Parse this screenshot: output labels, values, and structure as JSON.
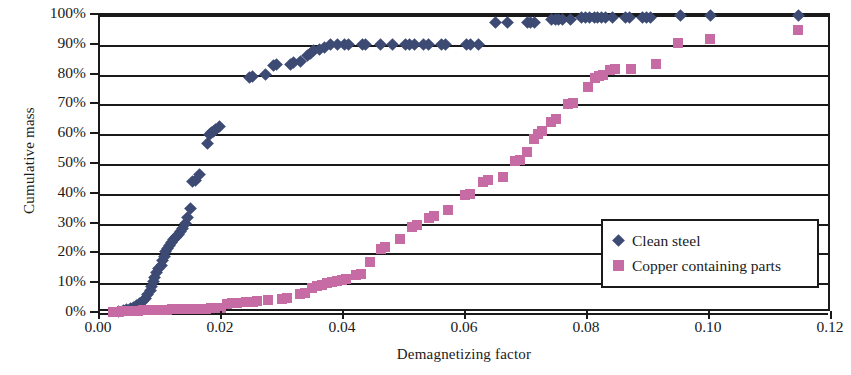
{
  "chart_data": {
    "type": "scatter",
    "title": "",
    "xlabel": "Demagnetizing factor",
    "ylabel": "Cumulative mass",
    "xlim": [
      0.0,
      0.12
    ],
    "ylim": [
      0,
      1.0
    ],
    "xticks": [
      0.0,
      0.02,
      0.04,
      0.06,
      0.08,
      0.1,
      0.12
    ],
    "xtick_labels": [
      "0.00",
      "0.02",
      "0.04",
      "0.06",
      "0.08",
      "0.10",
      "0.12"
    ],
    "yticks": [
      0,
      0.1,
      0.2,
      0.3,
      0.4,
      0.5,
      0.6,
      0.7,
      0.8,
      0.9,
      1.0
    ],
    "ytick_labels": [
      "0%",
      "10%",
      "20%",
      "30%",
      "40%",
      "50%",
      "60%",
      "70%",
      "80%",
      "90%",
      "100%"
    ],
    "grid": "horizontal",
    "legend_position": "inside-lower-right",
    "series": [
      {
        "name": "Clean steel",
        "marker": "diamond",
        "color": "#3c4a74",
        "points": [
          [
            0.003,
            0.005
          ],
          [
            0.0038,
            0.008
          ],
          [
            0.0044,
            0.012
          ],
          [
            0.005,
            0.016
          ],
          [
            0.0055,
            0.02
          ],
          [
            0.006,
            0.026
          ],
          [
            0.0065,
            0.032
          ],
          [
            0.007,
            0.04
          ],
          [
            0.0074,
            0.05
          ],
          [
            0.0078,
            0.062
          ],
          [
            0.0082,
            0.075
          ],
          [
            0.0085,
            0.09
          ],
          [
            0.0088,
            0.105
          ],
          [
            0.009,
            0.12
          ],
          [
            0.0093,
            0.135
          ],
          [
            0.0096,
            0.15
          ],
          [
            0.01,
            0.16
          ],
          [
            0.0103,
            0.175
          ],
          [
            0.0106,
            0.19
          ],
          [
            0.0108,
            0.205
          ],
          [
            0.0111,
            0.215
          ],
          [
            0.0114,
            0.225
          ],
          [
            0.0117,
            0.235
          ],
          [
            0.012,
            0.245
          ],
          [
            0.0123,
            0.252
          ],
          [
            0.0126,
            0.258
          ],
          [
            0.0129,
            0.265
          ],
          [
            0.0132,
            0.272
          ],
          [
            0.0136,
            0.285
          ],
          [
            0.014,
            0.3
          ],
          [
            0.0144,
            0.32
          ],
          [
            0.0148,
            0.35
          ],
          [
            0.0152,
            0.44
          ],
          [
            0.0156,
            0.445
          ],
          [
            0.0163,
            0.465
          ],
          [
            0.0176,
            0.57
          ],
          [
            0.018,
            0.6
          ],
          [
            0.0183,
            0.605
          ],
          [
            0.0186,
            0.61
          ],
          [
            0.019,
            0.615
          ],
          [
            0.0196,
            0.625
          ],
          [
            0.0245,
            0.79
          ],
          [
            0.025,
            0.795
          ],
          [
            0.0272,
            0.8
          ],
          [
            0.0285,
            0.83
          ],
          [
            0.029,
            0.835
          ],
          [
            0.0312,
            0.835
          ],
          [
            0.0318,
            0.84
          ],
          [
            0.0328,
            0.845
          ],
          [
            0.034,
            0.865
          ],
          [
            0.0345,
            0.87
          ],
          [
            0.035,
            0.88
          ],
          [
            0.036,
            0.885
          ],
          [
            0.0368,
            0.89
          ],
          [
            0.0378,
            0.9
          ],
          [
            0.039,
            0.9
          ],
          [
            0.04,
            0.9
          ],
          [
            0.0408,
            0.9
          ],
          [
            0.043,
            0.9
          ],
          [
            0.0436,
            0.9
          ],
          [
            0.046,
            0.9
          ],
          [
            0.048,
            0.9
          ],
          [
            0.05,
            0.9
          ],
          [
            0.0508,
            0.9
          ],
          [
            0.0516,
            0.9
          ],
          [
            0.053,
            0.9
          ],
          [
            0.0538,
            0.9
          ],
          [
            0.056,
            0.9
          ],
          [
            0.0566,
            0.9
          ],
          [
            0.06,
            0.9
          ],
          [
            0.0608,
            0.9
          ],
          [
            0.062,
            0.9
          ],
          [
            0.0648,
            0.975
          ],
          [
            0.0668,
            0.975
          ],
          [
            0.07,
            0.975
          ],
          [
            0.0706,
            0.975
          ],
          [
            0.0712,
            0.975
          ],
          [
            0.074,
            0.985
          ],
          [
            0.0746,
            0.985
          ],
          [
            0.0752,
            0.985
          ],
          [
            0.0758,
            0.985
          ],
          [
            0.0772,
            0.985
          ],
          [
            0.079,
            0.99
          ],
          [
            0.0796,
            0.99
          ],
          [
            0.0802,
            0.99
          ],
          [
            0.081,
            0.99
          ],
          [
            0.0816,
            0.99
          ],
          [
            0.0822,
            0.99
          ],
          [
            0.0828,
            0.99
          ],
          [
            0.084,
            0.99
          ],
          [
            0.0862,
            0.99
          ],
          [
            0.0868,
            0.99
          ],
          [
            0.089,
            0.99
          ],
          [
            0.0896,
            0.99
          ],
          [
            0.0902,
            0.99
          ],
          [
            0.0952,
            0.998
          ],
          [
            0.1,
            0.998
          ],
          [
            0.1145,
            1.0
          ]
        ]
      },
      {
        "name": "Copper containing parts",
        "marker": "square",
        "color": "#c76ba5",
        "points": [
          [
            0.0022,
            0.004
          ],
          [
            0.003,
            0.005
          ],
          [
            0.0038,
            0.006
          ],
          [
            0.0046,
            0.007
          ],
          [
            0.0054,
            0.008
          ],
          [
            0.0062,
            0.008
          ],
          [
            0.007,
            0.009
          ],
          [
            0.0078,
            0.009
          ],
          [
            0.0086,
            0.01
          ],
          [
            0.0094,
            0.01
          ],
          [
            0.0102,
            0.011
          ],
          [
            0.011,
            0.011
          ],
          [
            0.0118,
            0.012
          ],
          [
            0.0126,
            0.012
          ],
          [
            0.0134,
            0.013
          ],
          [
            0.0142,
            0.013
          ],
          [
            0.015,
            0.014
          ],
          [
            0.0158,
            0.014
          ],
          [
            0.0166,
            0.015
          ],
          [
            0.0174,
            0.015
          ],
          [
            0.0182,
            0.016
          ],
          [
            0.019,
            0.017
          ],
          [
            0.0198,
            0.018
          ],
          [
            0.0208,
            0.03
          ],
          [
            0.0216,
            0.032
          ],
          [
            0.0224,
            0.034
          ],
          [
            0.024,
            0.036
          ],
          [
            0.025,
            0.038
          ],
          [
            0.0258,
            0.04
          ],
          [
            0.0276,
            0.042
          ],
          [
            0.0298,
            0.048
          ],
          [
            0.0306,
            0.05
          ],
          [
            0.0328,
            0.065
          ],
          [
            0.0336,
            0.068
          ],
          [
            0.0348,
            0.085
          ],
          [
            0.0356,
            0.09
          ],
          [
            0.0364,
            0.095
          ],
          [
            0.0372,
            0.1
          ],
          [
            0.038,
            0.105
          ],
          [
            0.0388,
            0.108
          ],
          [
            0.0396,
            0.112
          ],
          [
            0.0404,
            0.115
          ],
          [
            0.042,
            0.128
          ],
          [
            0.0428,
            0.132
          ],
          [
            0.0442,
            0.17
          ],
          [
            0.046,
            0.215
          ],
          [
            0.0468,
            0.22
          ],
          [
            0.0492,
            0.25
          ],
          [
            0.0512,
            0.29
          ],
          [
            0.052,
            0.295
          ],
          [
            0.054,
            0.32
          ],
          [
            0.0548,
            0.325
          ],
          [
            0.057,
            0.345
          ],
          [
            0.0598,
            0.395
          ],
          [
            0.0606,
            0.4
          ],
          [
            0.0628,
            0.44
          ],
          [
            0.0636,
            0.445
          ],
          [
            0.066,
            0.455
          ],
          [
            0.068,
            0.51
          ],
          [
            0.0688,
            0.515
          ],
          [
            0.07,
            0.54
          ],
          [
            0.0712,
            0.585
          ],
          [
            0.0718,
            0.6
          ],
          [
            0.0724,
            0.61
          ],
          [
            0.074,
            0.64
          ],
          [
            0.0748,
            0.65
          ],
          [
            0.0768,
            0.7
          ],
          [
            0.0776,
            0.705
          ],
          [
            0.08,
            0.76
          ],
          [
            0.0812,
            0.79
          ],
          [
            0.0818,
            0.795
          ],
          [
            0.0824,
            0.8
          ],
          [
            0.0836,
            0.815
          ],
          [
            0.0844,
            0.82
          ],
          [
            0.087,
            0.82
          ],
          [
            0.0912,
            0.835
          ],
          [
            0.0948,
            0.905
          ],
          [
            0.1,
            0.92
          ],
          [
            0.1145,
            0.95
          ]
        ]
      }
    ]
  },
  "legend": {
    "entries": [
      {
        "label": "Clean steel",
        "marker": "diamond"
      },
      {
        "label": "Copper containing parts",
        "marker": "square"
      }
    ]
  },
  "colors": {
    "clean_steel": "#3c4a74",
    "copper_containing_parts": "#c76ba5",
    "axis": "#1a1a1a",
    "background": "#ffffff"
  }
}
